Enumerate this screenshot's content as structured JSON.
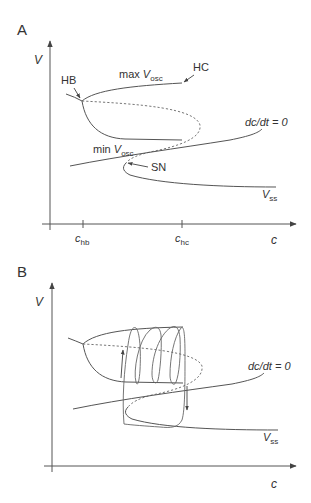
{
  "panels": [
    {
      "id": "A",
      "label": "A",
      "y_axis_label": "V",
      "x_axis_label": "c",
      "x_ticks": [
        {
          "base": "c",
          "sub": "hb"
        },
        {
          "base": "c",
          "sub": "hc"
        }
      ],
      "annotations": {
        "hb": "HB",
        "hc": "HC",
        "sn": "SN",
        "max_vosc": {
          "prefix": "max ",
          "base": "V",
          "sub": "osc"
        },
        "min_vosc": {
          "prefix": "min ",
          "base": "V",
          "sub": "osc"
        },
        "nullcline": "dc/dt = 0",
        "vss": {
          "base": "V",
          "sub": "ss"
        }
      }
    },
    {
      "id": "B",
      "label": "B",
      "y_axis_label": "V",
      "x_axis_label": "c",
      "annotations": {
        "nullcline": "dc/dt = 0",
        "vss": {
          "base": "V",
          "sub": "ss"
        }
      }
    }
  ],
  "colors": {
    "line": "#555555",
    "text": "#333333",
    "background": "#ffffff"
  }
}
